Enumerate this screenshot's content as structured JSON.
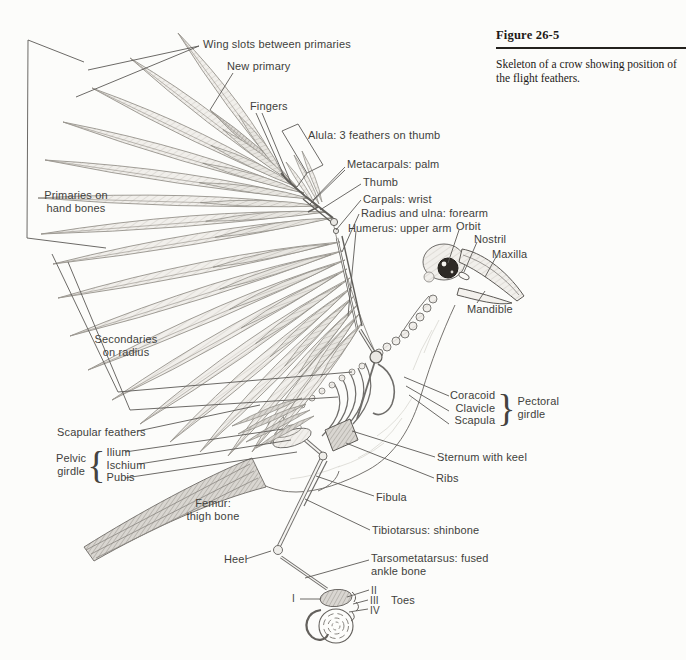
{
  "figure": {
    "title": "Figure 26-5",
    "caption": "Skeleton of a crow showing position of\nthe flight feathers."
  },
  "labels": {
    "wing_slots": "Wing slots between primaries",
    "new_primary": "New primary",
    "fingers": "Fingers",
    "alula": "Alula: 3 feathers on thumb",
    "metacarpals": "Metacarpals: palm",
    "thumb": "Thumb",
    "carpals": "Carpals: wrist",
    "radius_ulna": "Radius and ulna: forearm",
    "humerus": "Humerus: upper arm",
    "orbit": "Orbit",
    "nostril": "Nostril",
    "maxilla": "Maxilla",
    "mandible": "Mandible",
    "primaries": "Primaries on\nhand bones",
    "secondaries": "Secondaries\non radius",
    "scapular": "Scapular feathers",
    "pelvic_girdle": "Pelvic\ngirdle",
    "pelvic_brace": "{",
    "ilium": "Ilium",
    "ischium": "Ischium",
    "pubis": "Pubis",
    "coracoid": "Coracoid",
    "clavicle": "Clavicle",
    "scapula": "Scapula",
    "pectoral_brace": "}",
    "pectoral_girdle": "Pectoral\ngirdle",
    "sternum": "Sternum with keel",
    "ribs": "Ribs",
    "fibula": "Fibula",
    "femur": "Femur:\nthigh bone",
    "tibiotarsus": "Tibiotarsus: shinbone",
    "heel": "Heel",
    "tarsometatarsus": "Tarsometatarsus: fused\nankle bone",
    "toe_i": "I",
    "toe_ii": "II",
    "toe_iii": "III",
    "toe_iv": "IV",
    "toes": "Toes"
  },
  "colors": {
    "ink": "#413f3c",
    "leader": "#5b5956",
    "paper": "#fcfcfa"
  }
}
